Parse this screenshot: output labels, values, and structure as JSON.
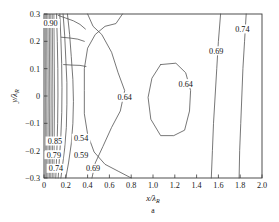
{
  "figure": {
    "caption": "a",
    "xlabel_main": "x/",
    "xlabel_lambda": "λ",
    "xlabel_sub": "R",
    "ylabel_main": "y/",
    "ylabel_lambda": "λ",
    "ylabel_sub": "R"
  },
  "axes": {
    "x_ticks": [
      "0",
      "0.2",
      "0.4",
      "0.6",
      "0.8",
      "1.0",
      "1.2",
      "1.4",
      "1.6",
      "1.8",
      "2.0"
    ],
    "y_ticks": [
      "0.3",
      "0.2",
      "0.1",
      "0",
      "−0.1",
      "−0.2",
      "−0.3"
    ]
  },
  "chart_data": {
    "type": "line",
    "title": "",
    "subtitle": "a",
    "xlabel": "x/λR",
    "ylabel": "y/λR",
    "xlim": [
      0,
      2.0
    ],
    "ylim": [
      -0.3,
      0.3
    ],
    "xticks": [
      0,
      0.2,
      0.4,
      0.6,
      0.8,
      1.0,
      1.2,
      1.4,
      1.6,
      1.8,
      2.0
    ],
    "yticks": [
      0.3,
      0.2,
      0.1,
      0,
      -0.1,
      -0.2,
      -0.3
    ],
    "grid": false,
    "legend": "none",
    "contour_levels": [
      0.54,
      0.59,
      0.64,
      0.69,
      0.74,
      0.79,
      0.85,
      0.9
    ],
    "inline_labels": [
      {
        "text": "0.90",
        "x": 0.06,
        "y": 0.265
      },
      {
        "text": "0.85",
        "x": 0.1,
        "y": -0.165
      },
      {
        "text": "0.54",
        "x": 0.34,
        "y": -0.155
      },
      {
        "text": "0.79",
        "x": 0.09,
        "y": -0.215
      },
      {
        "text": "0.59",
        "x": 0.34,
        "y": -0.215
      },
      {
        "text": "0.74",
        "x": 0.11,
        "y": -0.265
      },
      {
        "text": "0.69",
        "x": 0.45,
        "y": -0.265
      },
      {
        "text": "0.64",
        "x": 0.74,
        "y": -0.005
      },
      {
        "text": "0.64",
        "x": 1.3,
        "y": 0.045
      },
      {
        "text": "0.69",
        "x": 1.58,
        "y": 0.165
      },
      {
        "text": "0.74",
        "x": 1.82,
        "y": 0.245
      }
    ],
    "series": [
      {
        "name": "0.69-right",
        "points": [
          [
            1.62,
            0.3
          ],
          [
            1.6,
            0.2
          ],
          [
            1.585,
            0.1
          ],
          [
            1.57,
            0.0
          ],
          [
            1.555,
            -0.1
          ],
          [
            1.545,
            -0.2
          ],
          [
            1.535,
            -0.3
          ]
        ]
      },
      {
        "name": "0.74-right",
        "points": [
          [
            1.855,
            0.3
          ],
          [
            1.84,
            0.2
          ],
          [
            1.825,
            0.1
          ],
          [
            1.815,
            0.0
          ],
          [
            1.805,
            -0.1
          ],
          [
            1.795,
            -0.2
          ],
          [
            1.79,
            -0.3
          ]
        ]
      },
      {
        "name": "0.64-loop",
        "points": [
          [
            1.07,
            0.115
          ],
          [
            1.21,
            0.12
          ],
          [
            1.3,
            0.085
          ],
          [
            1.345,
            0.02
          ],
          [
            1.335,
            -0.055
          ],
          [
            1.29,
            -0.125
          ],
          [
            1.19,
            -0.145
          ],
          [
            1.07,
            -0.145
          ],
          [
            0.98,
            -0.085
          ],
          [
            0.955,
            -0.005
          ],
          [
            0.99,
            0.065
          ],
          [
            1.07,
            0.115
          ]
        ]
      },
      {
        "name": "0.64-neck",
        "points": [
          [
            0.4,
            0.3
          ],
          [
            0.45,
            0.255
          ],
          [
            0.53,
            0.225
          ],
          [
            0.62,
            0.16
          ],
          [
            0.68,
            0.085
          ],
          [
            0.74,
            0.02
          ],
          [
            0.7,
            -0.055
          ],
          [
            0.62,
            -0.115
          ],
          [
            0.54,
            -0.185
          ],
          [
            0.47,
            -0.245
          ],
          [
            0.44,
            -0.3
          ]
        ]
      },
      {
        "name": "0.69-lower",
        "points": [
          [
            0.72,
            0.3
          ],
          [
            0.66,
            0.265
          ],
          [
            0.56,
            0.255
          ],
          [
            0.47,
            0.225
          ],
          [
            0.4,
            0.175
          ],
          [
            0.37,
            0.1
          ],
          [
            0.37,
            0.02
          ],
          [
            0.37,
            -0.065
          ],
          [
            0.4,
            -0.14
          ],
          [
            0.46,
            -0.205
          ],
          [
            0.56,
            -0.25
          ],
          [
            0.68,
            -0.275
          ],
          [
            0.8,
            -0.3
          ]
        ]
      },
      {
        "name": "0.74-left",
        "points": [
          [
            0.215,
            0.3
          ],
          [
            0.235,
            0.225
          ],
          [
            0.25,
            0.145
          ],
          [
            0.265,
            0.06
          ],
          [
            0.27,
            -0.02
          ],
          [
            0.265,
            -0.1
          ],
          [
            0.25,
            -0.175
          ],
          [
            0.225,
            -0.245
          ],
          [
            0.2,
            -0.3
          ]
        ]
      },
      {
        "name": "0.79-left",
        "points": [
          [
            0.175,
            0.3
          ],
          [
            0.19,
            0.22
          ],
          [
            0.2,
            0.135
          ],
          [
            0.21,
            0.05
          ],
          [
            0.21,
            -0.03
          ],
          [
            0.205,
            -0.115
          ],
          [
            0.19,
            -0.19
          ],
          [
            0.17,
            -0.255
          ],
          [
            0.155,
            -0.3
          ]
        ]
      },
      {
        "name": "0.85-left",
        "points": [
          [
            0.145,
            0.3
          ],
          [
            0.155,
            0.21
          ],
          [
            0.162,
            0.12
          ],
          [
            0.165,
            0.03
          ],
          [
            0.163,
            -0.06
          ],
          [
            0.155,
            -0.145
          ],
          [
            0.142,
            -0.225
          ],
          [
            0.13,
            -0.3
          ]
        ]
      },
      {
        "name": "0.90-left",
        "points": [
          [
            0.115,
            0.3
          ],
          [
            0.122,
            0.2
          ],
          [
            0.127,
            0.1
          ],
          [
            0.128,
            0.0
          ],
          [
            0.125,
            -0.1
          ],
          [
            0.118,
            -0.2
          ],
          [
            0.108,
            -0.3
          ]
        ]
      },
      {
        "name": "dense-1",
        "points": [
          [
            0.012,
            0.3
          ],
          [
            0.013,
            0.0
          ],
          [
            0.012,
            -0.3
          ]
        ]
      },
      {
        "name": "dense-2",
        "points": [
          [
            0.024,
            0.3
          ],
          [
            0.026,
            0.0
          ],
          [
            0.024,
            -0.3
          ]
        ]
      },
      {
        "name": "dense-3",
        "points": [
          [
            0.036,
            0.3
          ],
          [
            0.039,
            0.0
          ],
          [
            0.036,
            -0.3
          ]
        ]
      },
      {
        "name": "dense-4",
        "points": [
          [
            0.049,
            0.3
          ],
          [
            0.052,
            0.0
          ],
          [
            0.049,
            -0.3
          ]
        ]
      },
      {
        "name": "dense-5",
        "points": [
          [
            0.062,
            0.3
          ],
          [
            0.066,
            0.0
          ],
          [
            0.062,
            -0.3
          ]
        ]
      },
      {
        "name": "dense-6",
        "points": [
          [
            0.076,
            0.3
          ],
          [
            0.081,
            0.0
          ],
          [
            0.076,
            -0.3
          ]
        ]
      },
      {
        "name": "dense-7",
        "points": [
          [
            0.091,
            0.3
          ],
          [
            0.097,
            0.0
          ],
          [
            0.091,
            -0.3
          ]
        ]
      },
      {
        "name": "upper-branch-1",
        "points": [
          [
            0.13,
            0.295
          ],
          [
            0.2,
            0.285
          ],
          [
            0.27,
            0.275
          ],
          [
            0.33,
            0.262
          ],
          [
            0.38,
            0.245
          ]
        ]
      },
      {
        "name": "upper-branch-2",
        "points": [
          [
            0.16,
            0.215
          ],
          [
            0.24,
            0.212
          ],
          [
            0.31,
            0.208
          ],
          [
            0.37,
            0.2
          ]
        ]
      },
      {
        "name": "upper-branch-3",
        "points": [
          [
            0.18,
            0.115
          ],
          [
            0.26,
            0.113
          ],
          [
            0.33,
            0.112
          ],
          [
            0.385,
            0.108
          ]
        ]
      }
    ]
  }
}
